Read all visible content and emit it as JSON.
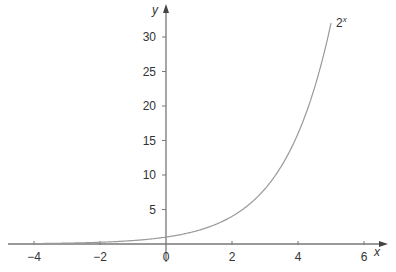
{
  "chart_data": {
    "type": "line",
    "title": "",
    "xlabel": "x",
    "ylabel": "y",
    "xlim": [
      -4.8,
      6.8
    ],
    "ylim": [
      0,
      33
    ],
    "grid": false,
    "x_ticks": [
      -4,
      -2,
      0,
      2,
      4,
      6
    ],
    "x_tick_labels": [
      "−4",
      "−2",
      "0",
      "2",
      "4",
      "6"
    ],
    "y_ticks": [
      5,
      10,
      15,
      20,
      25,
      30
    ],
    "y_tick_labels": [
      "5",
      "10",
      "15",
      "20",
      "25",
      "30"
    ],
    "series": [
      {
        "name": "2^x",
        "label_base": "2",
        "label_exp": "x",
        "function": "2^x",
        "x_range": [
          -4,
          5
        ],
        "x": [
          -4,
          -3,
          -2,
          -1,
          0,
          1,
          2,
          3,
          4,
          5
        ],
        "values": [
          0.0625,
          0.125,
          0.25,
          0.5,
          1,
          2,
          4,
          8,
          16,
          32
        ],
        "color": "#9a9a9a"
      }
    ],
    "axis_color": "#777777"
  }
}
